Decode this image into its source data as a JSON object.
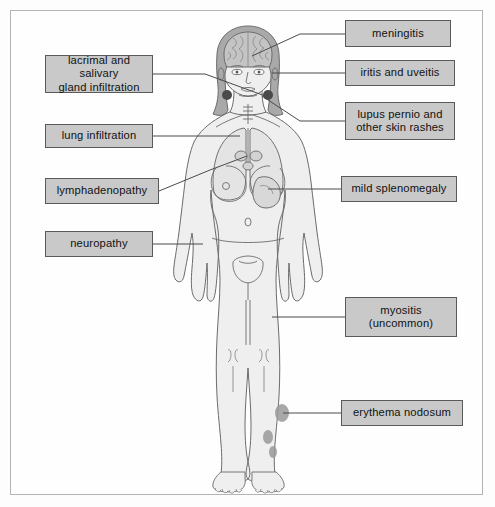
{
  "diagram": {
    "frame": {
      "border_color": "#b4b4b4",
      "background": "#fefefe"
    },
    "style": {
      "box_fill": "#c9c9c9",
      "box_border": "#5a5a5a",
      "connector_color": "#4a4a4a",
      "body_fill": "#efefef",
      "body_outline": "#6b6b6b",
      "hair_fill": "#a9a9a9",
      "brain_fill": "#c4c4c4",
      "lesion_fill": "#9a9a9a",
      "gland_fill": "#4a4a4a"
    },
    "callouts": [
      {
        "id": "lacrimal-salivary",
        "label": "lacrimal and salivary\ngland infiltration",
        "side": "left",
        "x": 45,
        "y": 55,
        "w": 108,
        "h": 38,
        "line": [
          [
            153,
            74
          ],
          [
            205,
            74
          ],
          [
            268,
            97
          ]
        ]
      },
      {
        "id": "lung-infiltration",
        "label": "lung infiltration",
        "side": "left",
        "x": 45,
        "y": 124,
        "w": 108,
        "h": 24,
        "line": [
          [
            153,
            136
          ],
          [
            240,
            136
          ]
        ]
      },
      {
        "id": "lymphadenopathy",
        "label": "lymphadenopathy",
        "side": "left",
        "x": 45,
        "y": 178,
        "w": 114,
        "h": 26,
        "line": [
          [
            159,
            191
          ],
          [
            210,
            170
          ],
          [
            247,
            156
          ]
        ]
      },
      {
        "id": "neuropathy",
        "label": "neuropathy",
        "side": "left",
        "x": 45,
        "y": 231,
        "w": 108,
        "h": 26,
        "line": [
          [
            153,
            244
          ],
          [
            203,
            244
          ]
        ]
      },
      {
        "id": "meningitis",
        "label": "meningitis",
        "side": "right",
        "x": 345,
        "y": 20,
        "w": 106,
        "h": 27,
        "line": [
          [
            345,
            34
          ],
          [
            300,
            34
          ],
          [
            252,
            56
          ]
        ]
      },
      {
        "id": "iritis-uveitis",
        "label": "iritis and uveitis",
        "side": "right",
        "x": 345,
        "y": 60,
        "w": 110,
        "h": 26,
        "line": [
          [
            345,
            73
          ],
          [
            272,
            73
          ]
        ]
      },
      {
        "id": "lupus-pernio",
        "label": "lupus pernio and\nother skin rashes",
        "side": "right",
        "x": 345,
        "y": 102,
        "w": 110,
        "h": 38,
        "line": [
          [
            345,
            121
          ],
          [
            300,
            121
          ],
          [
            262,
            96
          ]
        ]
      },
      {
        "id": "mild-splenomegaly",
        "label": "mild splenomegaly",
        "side": "right",
        "x": 341,
        "y": 176,
        "w": 116,
        "h": 26,
        "line": [
          [
            341,
            189
          ],
          [
            268,
            189
          ]
        ]
      },
      {
        "id": "myositis",
        "label": "myositis\n(uncommon)",
        "side": "right",
        "x": 345,
        "y": 297,
        "w": 112,
        "h": 40,
        "line": [
          [
            345,
            317
          ],
          [
            272,
            317
          ]
        ]
      },
      {
        "id": "erythema-nodosum",
        "label": "erythema nodosum",
        "side": "right",
        "x": 341,
        "y": 400,
        "w": 122,
        "h": 26,
        "line": [
          [
            341,
            413
          ],
          [
            283,
            413
          ]
        ]
      }
    ],
    "markers": [
      {
        "id": "salivary-gland-left",
        "cx": 227,
        "cy": 95,
        "r": 5
      },
      {
        "id": "salivary-gland-right",
        "cx": 268,
        "cy": 95,
        "r": 5
      },
      {
        "id": "erythema-lesion-upper",
        "cx": 282,
        "cy": 413,
        "rx": 7,
        "ry": 9
      },
      {
        "id": "erythema-lesion-mid",
        "cx": 268,
        "cy": 437,
        "rx": 5,
        "ry": 7
      },
      {
        "id": "erythema-lesion-low",
        "cx": 273,
        "cy": 452,
        "rx": 4,
        "ry": 6
      }
    ]
  }
}
